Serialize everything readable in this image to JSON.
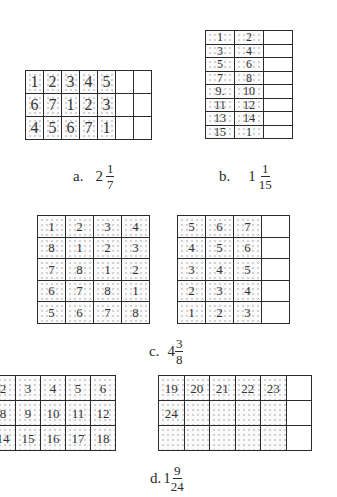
{
  "figures": {
    "a": {
      "label": "a.",
      "whole": "2",
      "numerator": "1",
      "denominator": "7",
      "columns": 7,
      "rows": [
        [
          "1",
          "2",
          "3",
          "4",
          "5",
          "",
          ""
        ],
        [
          "6",
          "7",
          "1",
          "2",
          "3",
          "",
          ""
        ],
        [
          "4",
          "5",
          "6",
          "7",
          "1",
          "",
          ""
        ]
      ],
      "shaded_columns": 5
    },
    "b": {
      "label": "b.",
      "whole": "1",
      "numerator": "1",
      "denominator": "15",
      "columns": 3,
      "rows": [
        [
          "1",
          "2",
          ""
        ],
        [
          "3",
          "4",
          ""
        ],
        [
          "5",
          "6",
          ""
        ],
        [
          "7",
          "8",
          ""
        ],
        [
          "9.",
          "10",
          ""
        ],
        [
          "11",
          "12",
          ""
        ],
        [
          "13",
          "14",
          ""
        ],
        [
          "15",
          "1",
          ""
        ]
      ],
      "shaded_columns": 2
    },
    "c": {
      "label": "c.",
      "whole": "4",
      "numerator": "3",
      "denominator": "8",
      "left_grid": {
        "rows": [
          [
            "1",
            "2",
            "3",
            "4"
          ],
          [
            "8",
            "1",
            "2",
            "3"
          ],
          [
            "7",
            "8",
            "1",
            "2"
          ],
          [
            "6",
            "7",
            "8",
            "1"
          ],
          [
            "5",
            "6",
            "7",
            "8"
          ]
        ],
        "shaded_columns": 4
      },
      "right_grid": {
        "rows": [
          [
            "5",
            "6",
            "7",
            ""
          ],
          [
            "4",
            "5",
            "6",
            ""
          ],
          [
            "3",
            "4",
            "5",
            ""
          ],
          [
            "2",
            "3",
            "4",
            ""
          ],
          [
            "1",
            "2",
            "3",
            ""
          ]
        ],
        "shaded_columns": 3
      }
    },
    "d": {
      "label": "d.",
      "whole": "1",
      "numerator": "9",
      "denominator": "24",
      "left_grid": {
        "rows": [
          [
            "2",
            "3",
            "4",
            "5",
            "6"
          ],
          [
            "8",
            "9",
            "10",
            "11",
            "12"
          ],
          [
            "14",
            "15",
            "16",
            "17",
            "18"
          ]
        ],
        "shaded_columns": 5
      },
      "right_grid": {
        "rows": [
          [
            "19",
            "20",
            "21",
            "22",
            "23",
            ""
          ],
          [
            "24",
            "",
            "",
            "",
            "",
            ""
          ],
          [
            "",
            "",
            "",
            "",
            "",
            ""
          ]
        ],
        "shaded_columns": 5
      }
    }
  }
}
